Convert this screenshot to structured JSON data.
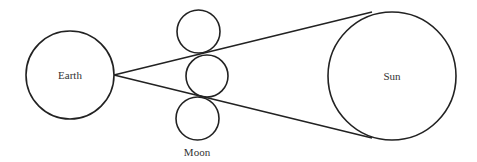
{
  "diagram": {
    "type": "eclipse-geometry",
    "labels": {
      "earth": "Earth",
      "sun": "Sun",
      "moon": "Moon"
    },
    "stroke_color": "#222222",
    "background": "#ffffff"
  }
}
